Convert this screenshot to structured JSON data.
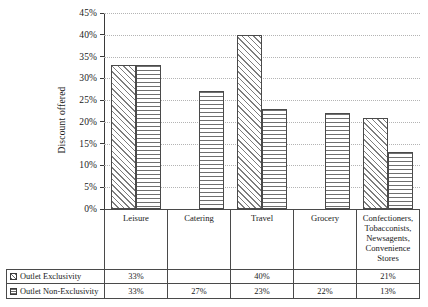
{
  "chart_data": {
    "type": "bar",
    "title": "",
    "xlabel": "",
    "ylabel": "Discount offered",
    "ylim": [
      0,
      45
    ],
    "ytick_labels": [
      "45%",
      "40%",
      "35%",
      "30%",
      "25%",
      "20%",
      "15%",
      "10%",
      "5%",
      "0%"
    ],
    "ytick_values": [
      45,
      40,
      35,
      30,
      25,
      20,
      15,
      10,
      5,
      0
    ],
    "grid": true,
    "legend_position": "bottom-table",
    "categories": [
      "Leisure",
      "Catering",
      "Travel",
      "Grocery",
      "Confectioners, Tobacconists, Newsagents, Convenience Stores"
    ],
    "category_lines": [
      [
        "Leisure"
      ],
      [
        "Catering"
      ],
      [
        "Travel"
      ],
      [
        "Grocery"
      ],
      [
        "Confectioners,",
        "Tobacconists,",
        "Newsagents,",
        "Convenience",
        "Stores"
      ]
    ],
    "series": [
      {
        "name": "Outlet Exclusivity",
        "pattern": "diagonal-hatch",
        "values": [
          33,
          null,
          40,
          null,
          21
        ],
        "labels": [
          "33%",
          "",
          "40%",
          "",
          "21%"
        ]
      },
      {
        "name": "Outlet Non-Exclusivity",
        "pattern": "horizontal-lines",
        "values": [
          33,
          27,
          23,
          22,
          13
        ],
        "labels": [
          "33%",
          "27%",
          "23%",
          "22%",
          "13%"
        ]
      }
    ]
  },
  "colors": {
    "axis": "#3a3a3a",
    "grid": "#b4b4b4",
    "bar_border": "#4a4a4a",
    "hatch": "#7d7d7d",
    "background": "#ffffff",
    "text": "#1a1a1a"
  }
}
